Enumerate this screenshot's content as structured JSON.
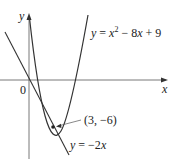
{
  "axes": {
    "x_label": "x",
    "y_label": "y",
    "origin_label": "0"
  },
  "curves": {
    "parabola": {
      "label_prefix": "y = ",
      "label_x": "x",
      "label_sup": "2",
      "label_rest": " − 8",
      "label_x2": "x",
      "label_tail": " + 9",
      "equation": "y = x^2 − 8x + 9"
    },
    "tangent": {
      "label_prefix": "y = −2",
      "label_x": "x",
      "equation": "y = −2x"
    }
  },
  "point": {
    "label": "(3, −6)",
    "x": 3,
    "y": -6
  },
  "colors": {
    "stroke": "#333333",
    "text": "#222222"
  }
}
